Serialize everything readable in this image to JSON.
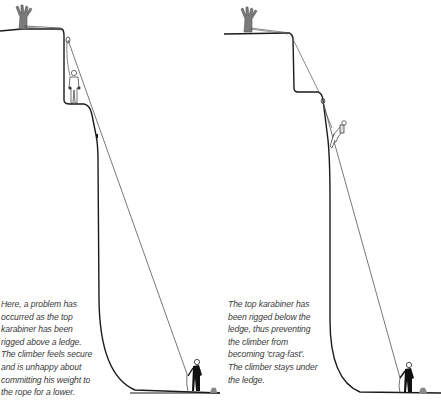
{
  "figure": {
    "panels": [
      {
        "id": "left",
        "scenario": "karabiner-above-ledge",
        "caption_lines": [
          "Here, a problem has",
          "occurred as the top",
          "karabiner has been",
          "rigged above a ledge.",
          "The climber feels secure",
          "and is unhappy about",
          "committing his weight to",
          "the rope for a lower."
        ]
      },
      {
        "id": "right",
        "scenario": "karabiner-below-ledge",
        "caption_lines": [
          "The top karabiner has",
          "been rigged below the",
          "ledge, thus preventing",
          "the climber from",
          "becoming 'crag-fast'.",
          "The climber stays under",
          "the ledge."
        ]
      }
    ],
    "icons": {
      "tree": "tree-anchor-icon",
      "climber": "climber-icon",
      "belayer": "belayer-icon",
      "karabiner": "karabiner-icon"
    },
    "colors": {
      "line": "#1a1a1a",
      "rope": "#555555",
      "tree": "#777777",
      "text": "#3a3a3a"
    }
  }
}
